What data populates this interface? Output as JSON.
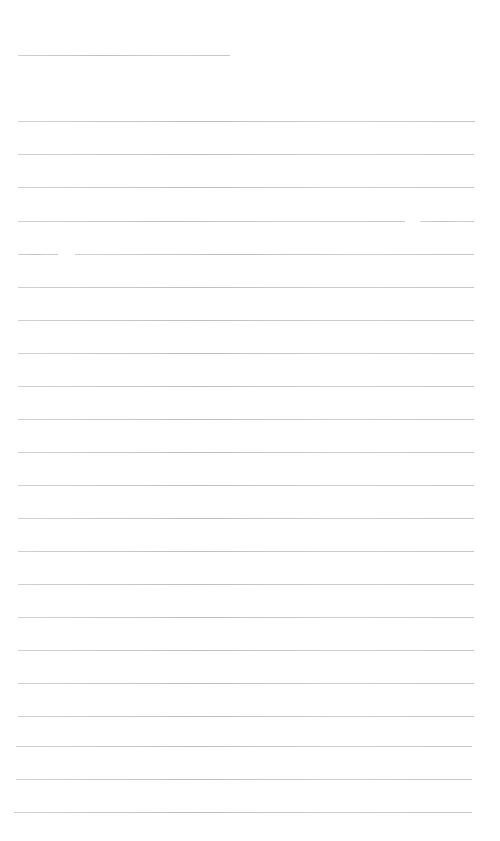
{
  "page": {
    "type": "ruled-sheet",
    "background": "#ffffff",
    "line_color": "#bcbcbc",
    "top_line": {
      "y": 55,
      "x1": 18,
      "x2": 230
    },
    "ruled_lines": [
      {
        "y": 121,
        "segments": [
          [
            18,
            475
          ]
        ]
      },
      {
        "y": 154,
        "segments": [
          [
            18,
            474
          ]
        ]
      },
      {
        "y": 187,
        "segments": [
          [
            18,
            474
          ]
        ]
      },
      {
        "y": 221,
        "segments": [
          [
            18,
            405
          ],
          [
            420,
            474
          ]
        ]
      },
      {
        "y": 254,
        "segments": [
          [
            18,
            58
          ],
          [
            75,
            474
          ]
        ]
      },
      {
        "y": 287,
        "segments": [
          [
            18,
            474
          ]
        ]
      },
      {
        "y": 320,
        "segments": [
          [
            18,
            474
          ]
        ]
      },
      {
        "y": 353,
        "segments": [
          [
            18,
            474
          ]
        ]
      },
      {
        "y": 386,
        "segments": [
          [
            18,
            474
          ]
        ]
      },
      {
        "y": 419,
        "segments": [
          [
            18,
            474
          ]
        ]
      },
      {
        "y": 452,
        "segments": [
          [
            18,
            474
          ]
        ]
      },
      {
        "y": 485,
        "segments": [
          [
            18,
            474
          ]
        ]
      },
      {
        "y": 518,
        "segments": [
          [
            18,
            474
          ]
        ]
      },
      {
        "y": 551,
        "segments": [
          [
            18,
            474
          ]
        ]
      },
      {
        "y": 584,
        "segments": [
          [
            18,
            474
          ]
        ]
      },
      {
        "y": 617,
        "segments": [
          [
            18,
            474
          ]
        ]
      },
      {
        "y": 650,
        "segments": [
          [
            18,
            474
          ]
        ]
      },
      {
        "y": 683,
        "segments": [
          [
            18,
            474
          ]
        ]
      },
      {
        "y": 716,
        "segments": [
          [
            18,
            474
          ]
        ]
      },
      {
        "y": 746,
        "segments": [
          [
            16,
            472
          ]
        ]
      },
      {
        "y": 779,
        "segments": [
          [
            16,
            472
          ]
        ]
      },
      {
        "y": 812,
        "segments": [
          [
            14,
            472
          ]
        ]
      }
    ]
  }
}
